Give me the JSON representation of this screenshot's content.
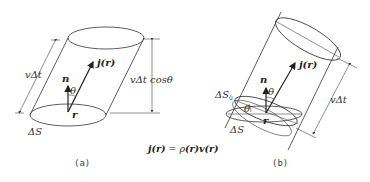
{
  "figure": {
    "panel_a": {
      "caption": "(a)",
      "labels": {
        "slant_length": "vΔt",
        "height": "vΔt cosθ",
        "normal": "n",
        "current": "j(r)",
        "angle": "θ",
        "position": "r",
        "area": "ΔS"
      }
    },
    "panel_b": {
      "caption": "(b)",
      "labels": {
        "length": "vΔt",
        "normal": "n",
        "current": "j(r)",
        "angle_top": "θ",
        "angle_side": "θ",
        "position": "r",
        "area": "ΔS",
        "area_perp": "ΔS",
        "area_perp_sub": "0"
      }
    },
    "equation": {
      "lhs_j": "j",
      "lhs_arg": "(r)",
      "eq": " = ρ",
      "rho_arg": "(r)",
      "v": "v",
      "v_arg": "(r)"
    }
  }
}
